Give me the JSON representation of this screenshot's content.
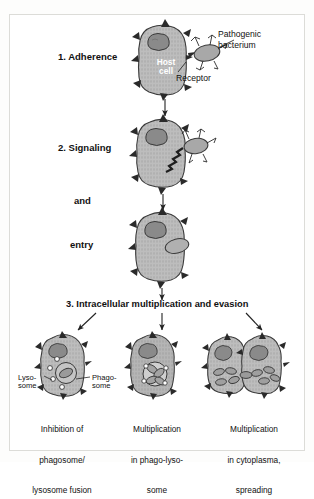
{
  "figure": {
    "colors": {
      "cell_fill": "#b8b8b8",
      "cell_stroke": "#333333",
      "nucleus_fill": "#8a8a8a",
      "bacterium_fill": "#a8a8a8",
      "background": "#ffffff",
      "text": "#111111"
    }
  },
  "steps": {
    "step1_label": "1. Adherence",
    "step2_label": "2. Signaling",
    "step2_and": "and",
    "step2_entry": "entry",
    "step3_label": "3. Intracellular multiplication and evasion"
  },
  "annotations": {
    "host_cell_line1": "Host",
    "host_cell_line2": "cell",
    "pathogenic_line1": "Pathogenic",
    "pathogenic_line2": "bacterium",
    "receptor": "Receptor",
    "lysosome_line1": "Lyso-",
    "lysosome_line2": "some",
    "phagosome_line1": "Phago-",
    "phagosome_line2": "some"
  },
  "outcomes": [
    {
      "id": "inhibition-fusion",
      "caption_line1": "Inhibition of",
      "caption_line2": "phagosome/",
      "caption_line3": "lysosome fusion"
    },
    {
      "id": "multiplication-phagolysosome",
      "caption_line1": "Multiplication",
      "caption_line2": "in phago-lyso-",
      "caption_line3": "some"
    },
    {
      "id": "multiplication-cytoplasm",
      "caption_line1": "Multiplication",
      "caption_line2": "in cytoplasma,",
      "caption_line3": "spreading"
    }
  ]
}
